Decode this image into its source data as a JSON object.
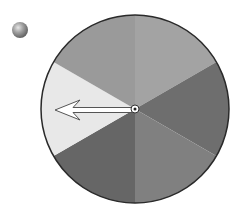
{
  "diagram": {
    "type": "spinner",
    "sector_count": 6,
    "center": [
      135,
      109
    ],
    "radius": 94,
    "outline_color": "#2a2a2a",
    "sectors": [
      {
        "name": "top-right",
        "start_deg": -90,
        "end_deg": -30,
        "color": "#a3a3a3"
      },
      {
        "name": "right",
        "start_deg": -30,
        "end_deg": 30,
        "color": "#6e6e6e"
      },
      {
        "name": "bottom-right",
        "start_deg": 30,
        "end_deg": 90,
        "color": "#808080"
      },
      {
        "name": "bottom-left",
        "start_deg": 90,
        "end_deg": 150,
        "color": "#666666"
      },
      {
        "name": "left",
        "start_deg": 150,
        "end_deg": 210,
        "color": "#e8e8e8"
      },
      {
        "name": "top-left",
        "start_deg": 210,
        "end_deg": 270,
        "color": "#9a9a9a"
      }
    ],
    "arrow": {
      "points_to": "left",
      "tip": [
        55,
        110
      ],
      "fill": "#ffffff",
      "stroke": "#555555"
    },
    "pivot": {
      "center": [
        135,
        109
      ],
      "radius": 3
    },
    "bullet": {
      "center": [
        20,
        30
      ],
      "radius": 8,
      "color": "#8c8c8c"
    }
  }
}
